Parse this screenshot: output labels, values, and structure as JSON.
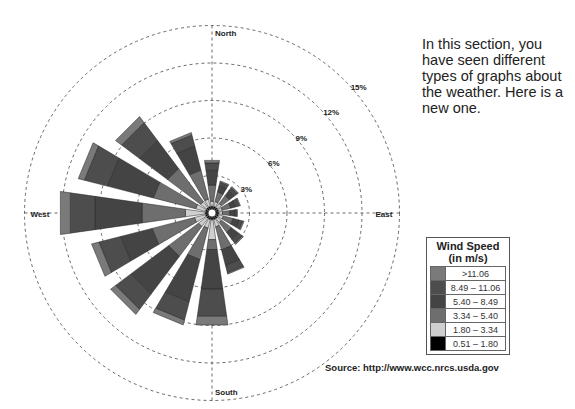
{
  "intro_text": "In this section, you have seen different types of graphs about the weather. Here is a new one.",
  "source": "Source: http://www.wcc.nrcs.usda.gov",
  "legend": {
    "title_line1": "Wind Speed",
    "title_line2": "(in m/s)",
    "items": [
      {
        "label": ">11.06",
        "color": "#7a7a7a"
      },
      {
        "label": "8.49 – 11.06",
        "color": "#4d4d4d"
      },
      {
        "label": "5.40 – 8.49",
        "color": "#444444"
      },
      {
        "label": "3.34 – 5.40",
        "color": "#6e6e6e"
      },
      {
        "label": "1.80 – 3.34",
        "color": "#cfcfcf"
      },
      {
        "label": "0.51 – 1.80",
        "color": "#000000"
      }
    ]
  },
  "chart_data": {
    "type": "wind-rose",
    "title": "Wind Speed (in m/s)",
    "compass_labels": {
      "north": "North",
      "east": "East",
      "south": "South",
      "west": "West"
    },
    "radial_ticks": [
      "3%",
      "6%",
      "9%",
      "12%",
      "15%"
    ],
    "radial_values": [
      3,
      6,
      9,
      12,
      15
    ],
    "rlim": [
      0,
      15
    ],
    "grid": true,
    "legend_position": "right",
    "speed_bins": [
      "0.51–1.80",
      "1.80–3.34",
      "3.34–5.40",
      "5.40–8.49",
      "8.49–11.06",
      ">11.06"
    ],
    "directions": [
      "N",
      "NNE",
      "NE",
      "ENE",
      "E",
      "ESE",
      "SE",
      "SSE",
      "S",
      "SSW",
      "SW",
      "WSW",
      "W",
      "WNW",
      "NW",
      "NNW"
    ],
    "angles_deg": [
      0,
      22.5,
      45,
      67.5,
      90,
      112.5,
      135,
      157.5,
      180,
      202.5,
      225,
      247.5,
      270,
      292.5,
      315,
      337.5
    ],
    "series": [
      {
        "name": "0.51–1.80",
        "values": [
          0.3,
          0.3,
          0.3,
          0.3,
          0.3,
          0.3,
          0.3,
          0.3,
          0.3,
          0.3,
          0.3,
          0.3,
          0.3,
          0.3,
          0.3,
          0.3
        ]
      },
      {
        "name": "1.80–3.34",
        "values": [
          0.4,
          0.4,
          0.4,
          0.3,
          0.3,
          0.4,
          0.4,
          0.6,
          1.6,
          0.7,
          0.8,
          0.9,
          1.6,
          0.8,
          0.6,
          0.6
        ]
      },
      {
        "name": "3.34–5.40",
        "values": [
          1.3,
          0.8,
          0.8,
          0.7,
          0.6,
          0.8,
          1.0,
          1.9,
          0.8,
          2.6,
          3.0,
          3.5,
          3.5,
          3.5,
          3.3,
          2.4
        ]
      },
      {
        "name": "5.40–8.49",
        "values": [
          1.2,
          0.5,
          0.5,
          0.4,
          0.4,
          0.5,
          0.7,
          1.3,
          3.2,
          3.5,
          3.8,
          2.6,
          3.8,
          3.8,
          2.8,
          2.0
        ]
      },
      {
        "name": "8.49–11.06",
        "values": [
          0.6,
          0.3,
          0.3,
          0.3,
          0.2,
          0.3,
          0.4,
          0.6,
          2.2,
          1.5,
          1.5,
          1.8,
          2.0,
          1.9,
          1.8,
          0.9
        ]
      },
      {
        "name": ">11.06",
        "values": [
          0.2,
          0.1,
          0.1,
          0.1,
          0.0,
          0.1,
          0.1,
          0.1,
          0.7,
          0.4,
          0.5,
          0.6,
          0.8,
          0.5,
          0.6,
          0.2
        ]
      }
    ],
    "totals_pct": [
      4.0,
      2.4,
      2.4,
      2.1,
      1.8,
      2.4,
      2.9,
      4.8,
      8.8,
      9.0,
      9.9,
      9.7,
      12.0,
      10.8,
      9.4,
      6.4
    ]
  }
}
